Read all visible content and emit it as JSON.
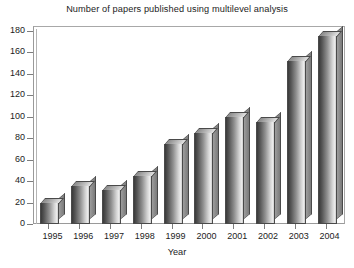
{
  "chart_data": {
    "type": "bar",
    "title": "Number of papers published using multilevel analysis",
    "xlabel": "Year",
    "ylabel": "",
    "categories": [
      "1995",
      "1996",
      "1997",
      "1998",
      "1999",
      "2000",
      "2001",
      "2002",
      "2003",
      "2004"
    ],
    "values": [
      20,
      35,
      32,
      45,
      75,
      85,
      100,
      95,
      152,
      175
    ],
    "ylim": [
      0,
      180
    ],
    "ytick_labels": [
      "0",
      "20",
      "40",
      "60",
      "80",
      "100",
      "120",
      "140",
      "160",
      "180"
    ],
    "ytick_values": [
      0,
      20,
      40,
      60,
      80,
      100,
      120,
      140,
      160,
      180
    ],
    "grid": false,
    "legend": null,
    "style": "3d-bar-grayscale",
    "colors": {
      "bar_face_dark": "#3a3a3a",
      "bar_face_light": "#ededed",
      "bar_edge": "#4a4a4a",
      "axis": "#7d7d7d",
      "frame": "#9a9a9a",
      "text": "#1c1c1c",
      "background": "#ffffff"
    }
  }
}
